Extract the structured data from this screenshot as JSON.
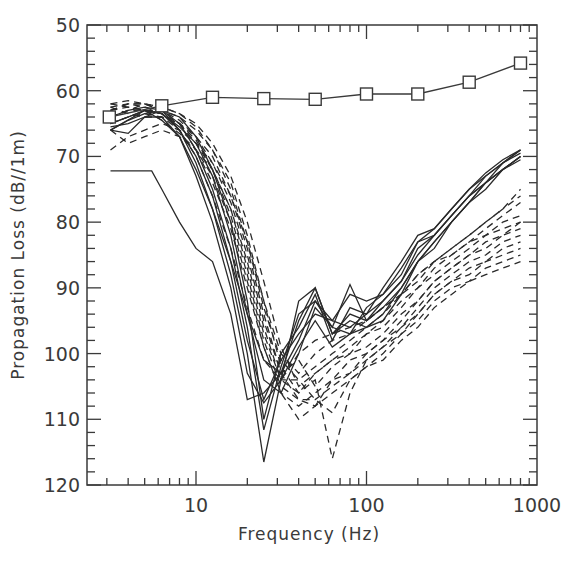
{
  "chart_data": {
    "type": "line",
    "title": "",
    "xlabel": "Frequency (Hz)",
    "ylabel": "Propagation Loss (dB//1m)",
    "xscale": "log",
    "xlim": [
      2.27,
      1000
    ],
    "ylim": [
      120,
      50
    ],
    "y_inverted": true,
    "grid": false,
    "legend": null,
    "x_tick_labels": [
      "10",
      "100",
      "1000"
    ],
    "x_ticks": [
      10,
      100,
      1000
    ],
    "y_tick_labels": [
      "50",
      "60",
      "70",
      "80",
      "90",
      "100",
      "110",
      "120"
    ],
    "y_ticks": [
      50,
      60,
      70,
      80,
      90,
      100,
      110,
      120
    ],
    "series": [
      {
        "name": "reference (square markers)",
        "style": "solid-markers",
        "marker": "square",
        "x": [
          3.1,
          6.3,
          12.5,
          25,
          50,
          100,
          200,
          400,
          800
        ],
        "values": [
          64.0,
          62.3,
          61.0,
          61.2,
          61.3,
          60.5,
          60.5,
          58.7,
          55.8
        ]
      },
      {
        "name": "solid 1",
        "style": "solid",
        "x": [
          3.15,
          5,
          6.3,
          8,
          10,
          12.5,
          16,
          20,
          25,
          31.5,
          40,
          50,
          63,
          80,
          100,
          125,
          160,
          200,
          250,
          315,
          400,
          500,
          630,
          800
        ],
        "values": [
          66.0,
          63.0,
          64.5,
          67.0,
          72.0,
          78.0,
          86.0,
          94.0,
          101.0,
          103.0,
          95.0,
          90.0,
          97.0,
          94.0,
          95.0,
          93.0,
          90.0,
          86.0,
          83.0,
          80.0,
          77.0,
          74.0,
          71.0,
          69.0
        ]
      },
      {
        "name": "solid 2",
        "style": "solid",
        "x": [
          3.15,
          5.5,
          6.3,
          8,
          10,
          12.5,
          16,
          20,
          25,
          31.5,
          40,
          50,
          63,
          80,
          100,
          125,
          160,
          200,
          250,
          315,
          400,
          500,
          630,
          800
        ],
        "values": [
          72.2,
          72.2,
          75.0,
          80.0,
          84.0,
          86.0,
          94.0,
          107.0,
          106.0,
          103.0,
          98.0,
          92.0,
          95.0,
          91.0,
          92.0,
          91.0,
          88.0,
          83.0,
          82.0,
          79.0,
          76.0,
          74.0,
          72.0,
          70.0
        ]
      },
      {
        "name": "solid 3",
        "style": "solid",
        "x": [
          3.15,
          4,
          5,
          6.3,
          8,
          10,
          12.5,
          16,
          20,
          25,
          31.5,
          40,
          50,
          63,
          80,
          100,
          125,
          160,
          200,
          250,
          315,
          400,
          500,
          630,
          800
        ],
        "values": [
          65.0,
          64.0,
          63.0,
          63.5,
          66.0,
          71.0,
          78.0,
          88.0,
          100.0,
          116.5,
          104.0,
          92.0,
          90.0,
          97.0,
          95.0,
          96.0,
          94.0,
          90.0,
          86.0,
          83.0,
          80.0,
          77.0,
          74.0,
          72.0,
          70.0
        ]
      },
      {
        "name": "solid 4",
        "style": "solid",
        "x": [
          3.15,
          4,
          5,
          6.3,
          8,
          10,
          12.5,
          16,
          20,
          25,
          31.5,
          40,
          50,
          63,
          80,
          100,
          125,
          160,
          200,
          250,
          315,
          400,
          500,
          630,
          800
        ],
        "values": [
          64.0,
          63.0,
          62.5,
          63.0,
          65.0,
          69.0,
          75.0,
          84.0,
          96.0,
          111.6,
          102.0,
          94.0,
          92.0,
          96.0,
          89.5,
          95.0,
          92.0,
          89.0,
          84.0,
          82.0,
          79.0,
          76.0,
          73.0,
          71.0,
          69.5
        ]
      },
      {
        "name": "solid 5",
        "style": "solid",
        "x": [
          3.15,
          4,
          5,
          6.3,
          8,
          10,
          12.5,
          16,
          20,
          25,
          31.5,
          40,
          50,
          63,
          80,
          100,
          125,
          160,
          200,
          250,
          315,
          400,
          500,
          630,
          800
        ],
        "values": [
          66.0,
          64.5,
          63.5,
          63.0,
          64.0,
          67.0,
          72.0,
          80.0,
          92.0,
          110.0,
          100.0,
          96.0,
          91.0,
          98.0,
          93.0,
          94.0,
          90.0,
          86.0,
          82.0,
          81.0,
          78.0,
          75.0,
          72.5,
          70.5,
          69.0
        ]
      },
      {
        "name": "solid 6",
        "style": "solid",
        "x": [
          3.15,
          4,
          5,
          6.3,
          8,
          10,
          12.5,
          16,
          20,
          25,
          31.5,
          40,
          50,
          63,
          80,
          100,
          125,
          160,
          200,
          250,
          315,
          400,
          500,
          630,
          800
        ],
        "values": [
          65.0,
          64.0,
          63.0,
          63.5,
          65.5,
          68.0,
          73.0,
          82.0,
          94.0,
          104.0,
          106.0,
          100.0,
          93.0,
          96.0,
          97.0,
          93.0,
          91.0,
          87.0,
          83.0,
          81.0,
          78.0,
          75.0,
          73.0,
          71.0,
          69.0
        ]
      },
      {
        "name": "solid 7",
        "style": "solid",
        "x": [
          3.15,
          4,
          5,
          6.3,
          8,
          10,
          12.5,
          16,
          20,
          25,
          31.5,
          40,
          50,
          63,
          80,
          100,
          125,
          160,
          200,
          250,
          315,
          400,
          500,
          630,
          800
        ],
        "values": [
          65.5,
          65.0,
          64.0,
          63.0,
          66.0,
          70.0,
          76.0,
          86.0,
          98.0,
          107.0,
          101.0,
          97.0,
          94.0,
          95.0,
          96.0,
          94.0,
          92.0,
          89.0,
          85.0,
          82.0,
          79.0,
          76.0,
          74.0,
          72.0,
          70.5
        ]
      },
      {
        "name": "solid 8",
        "style": "solid",
        "x": [
          3.15,
          4,
          5,
          6.3,
          8,
          10,
          12.5,
          16,
          20,
          25,
          31.5,
          40,
          50,
          63,
          80,
          100,
          125,
          160,
          200,
          250,
          315,
          400,
          500,
          630,
          800
        ],
        "values": [
          66.0,
          66.5,
          64.0,
          64.0,
          67.0,
          73.0,
          80.0,
          90.0,
          103.0,
          107.5,
          104.0,
          99.0,
          95.0,
          99.0,
          97.0,
          96.0,
          95.0,
          91.0,
          86.0,
          84.0,
          80.0,
          77.0,
          75.0,
          72.0,
          70.0
        ]
      },
      {
        "name": "dashed 1",
        "style": "dashed",
        "x": [
          3.15,
          4,
          5,
          6.3,
          8,
          10,
          12.5,
          16,
          20,
          25,
          31.5,
          40,
          50,
          63,
          80,
          100,
          125,
          160,
          200,
          250,
          315,
          400,
          500,
          630,
          800
        ],
        "values": [
          62.0,
          62.5,
          63.0,
          63.0,
          64.0,
          66.0,
          69.0,
          74.0,
          82.0,
          92.0,
          102.0,
          106.0,
          104.0,
          116.0,
          106.0,
          101.0,
          99.0,
          96.0,
          93.0,
          90.0,
          88.0,
          86.0,
          85.0,
          83.0,
          82.0
        ]
      },
      {
        "name": "dashed 2",
        "style": "dashed",
        "x": [
          3.15,
          4,
          5,
          6.3,
          8,
          10,
          12.5,
          16,
          20,
          25,
          31.5,
          40,
          50,
          63,
          80,
          100,
          125,
          160,
          200,
          250,
          315,
          400,
          500,
          630,
          800
        ],
        "values": [
          63.0,
          62.0,
          62.5,
          63.5,
          65.0,
          67.0,
          70.0,
          76.0,
          84.0,
          94.0,
          103.0,
          107.0,
          108.0,
          104.0,
          103.0,
          100.0,
          98.0,
          95.0,
          92.0,
          89.0,
          87.0,
          85.0,
          84.0,
          82.0,
          80.0
        ]
      },
      {
        "name": "dashed 3",
        "style": "dashed",
        "x": [
          3.15,
          4,
          5,
          6.3,
          8,
          10,
          12.5,
          16,
          20,
          25,
          31.5,
          40,
          50,
          63,
          80,
          100,
          125,
          160,
          200,
          250,
          315,
          400,
          500,
          630,
          800
        ],
        "values": [
          64.0,
          63.0,
          62.0,
          62.5,
          63.5,
          65.0,
          68.0,
          73.0,
          80.0,
          89.0,
          99.0,
          105.0,
          103.0,
          101.0,
          99.0,
          97.0,
          95.0,
          92.0,
          90.0,
          87.0,
          85.0,
          83.0,
          81.0,
          79.0,
          77.0
        ]
      },
      {
        "name": "dashed 4",
        "style": "dashed",
        "x": [
          3.15,
          4,
          5,
          6.3,
          8,
          10,
          12.5,
          16,
          20,
          25,
          31.5,
          40,
          50,
          63,
          80,
          100,
          125,
          160,
          200,
          250,
          315,
          400,
          500,
          630,
          800
        ],
        "values": [
          62.5,
          63.5,
          64.0,
          64.0,
          65.0,
          68.0,
          72.0,
          78.0,
          86.0,
          96.0,
          104.0,
          104.0,
          107.0,
          109.0,
          104.0,
          102.0,
          100.0,
          97.0,
          94.0,
          91.0,
          89.0,
          87.0,
          86.0,
          84.0,
          83.0
        ]
      },
      {
        "name": "dashed 5",
        "style": "dashed",
        "x": [
          3.15,
          4,
          5,
          6.3,
          8,
          10,
          12.5,
          16,
          20,
          25,
          31.5,
          40,
          50,
          63,
          80,
          100,
          125,
          160,
          200,
          250,
          315,
          400,
          500,
          630,
          800
        ],
        "values": [
          69.0,
          67.0,
          66.0,
          65.0,
          66.0,
          68.0,
          71.0,
          76.0,
          83.0,
          92.0,
          100.0,
          103.0,
          100.0,
          98.0,
          97.0,
          95.0,
          93.0,
          91.0,
          88.0,
          86.0,
          84.0,
          82.0,
          80.0,
          78.0,
          76.0
        ]
      },
      {
        "name": "dashed 6",
        "style": "dashed",
        "x": [
          3.15,
          4,
          5,
          6.3,
          8,
          10,
          12.5,
          16,
          20,
          25,
          31.5,
          40,
          50,
          63,
          80,
          100,
          125,
          160,
          200,
          250,
          315,
          400,
          500,
          630,
          800
        ],
        "values": [
          63.0,
          62.0,
          62.0,
          63.0,
          64.5,
          67.0,
          71.0,
          77.0,
          85.0,
          95.0,
          103.0,
          101.0,
          105.0,
          102.0,
          100.0,
          99.0,
          97.0,
          94.0,
          92.0,
          89.0,
          87.0,
          85.0,
          83.0,
          82.0,
          81.0
        ]
      },
      {
        "name": "dashed 7",
        "style": "dashed",
        "x": [
          3.15,
          4,
          5,
          6.3,
          8,
          10,
          12.5,
          16,
          20,
          25,
          31.5,
          40,
          50,
          63,
          80,
          100,
          125,
          160,
          200,
          250,
          315,
          400,
          500,
          630,
          800
        ],
        "values": [
          62.0,
          61.5,
          62.0,
          63.0,
          65.0,
          69.0,
          74.0,
          81.0,
          90.0,
          99.0,
          106.0,
          108.0,
          106.0,
          104.0,
          101.0,
          100.0,
          98.0,
          96.0,
          94.0,
          91.0,
          89.0,
          88.0,
          86.0,
          85.0,
          84.0
        ]
      },
      {
        "name": "dashed 8",
        "style": "dashed",
        "x": [
          3.15,
          4,
          5,
          6.3,
          8,
          10,
          12.5,
          16,
          20,
          25,
          31.5,
          40,
          50,
          63,
          80,
          100,
          125,
          160,
          200,
          250,
          315,
          400,
          500,
          630,
          800
        ],
        "values": [
          66.0,
          68.0,
          67.0,
          66.0,
          67.0,
          69.0,
          72.0,
          78.0,
          87.0,
          97.0,
          104.0,
          106.0,
          103.0,
          101.0,
          100.0,
          97.0,
          96.0,
          93.0,
          90.0,
          88.0,
          86.0,
          84.0,
          82.0,
          80.0,
          79.0
        ]
      },
      {
        "name": "dashed 9",
        "style": "dashed",
        "x": [
          3.15,
          4,
          5,
          6.3,
          8,
          10,
          12.5,
          16,
          20,
          25,
          31.5,
          40,
          50,
          63,
          80,
          100,
          125,
          160,
          200,
          250,
          315,
          400,
          500,
          630,
          800
        ],
        "values": [
          62.5,
          62.0,
          62.0,
          62.5,
          63.5,
          65.5,
          69.0,
          75.0,
          83.0,
          93.0,
          101.0,
          104.0,
          102.0,
          100.0,
          98.0,
          96.0,
          94.0,
          91.0,
          89.0,
          86.0,
          84.0,
          82.0,
          80.0,
          78.0,
          75.0
        ]
      },
      {
        "name": "dashed 10",
        "style": "dashed",
        "x": [
          3.15,
          4,
          5,
          6.3,
          8,
          10,
          12.5,
          16,
          20,
          25,
          31.5,
          40,
          50,
          63,
          80,
          100,
          125,
          160,
          200,
          250,
          315,
          400,
          500,
          630,
          800
        ],
        "values": [
          64.0,
          63.0,
          63.0,
          63.5,
          65.0,
          67.5,
          72.0,
          79.0,
          88.0,
          98.0,
          105.0,
          107.0,
          107.0,
          105.0,
          103.0,
          101.0,
          99.0,
          97.0,
          95.0,
          92.0,
          90.0,
          89.0,
          87.0,
          86.0,
          85.0
        ]
      },
      {
        "name": "dashed 11",
        "style": "dashed",
        "x": [
          3.15,
          4,
          5,
          6.3,
          8,
          10,
          12.5,
          16,
          20,
          25,
          31.5,
          40,
          50,
          63,
          80,
          100,
          125,
          160,
          200,
          250,
          315,
          400,
          500,
          630,
          800
        ],
        "values": [
          65.0,
          64.0,
          63.5,
          64.0,
          66.0,
          70.0,
          76.0,
          84.0,
          93.0,
          101.0,
          104.0,
          100.0,
          98.0,
          97.0,
          96.0,
          95.0,
          93.0,
          91.0,
          88.0,
          86.0,
          85.0,
          83.0,
          82.0,
          81.0,
          80.0
        ]
      },
      {
        "name": "dashed 12",
        "style": "dashed",
        "x": [
          3.15,
          4,
          5,
          6.3,
          8,
          10,
          12.5,
          16,
          20,
          25,
          31.5,
          40,
          50,
          63,
          80,
          100,
          125,
          160,
          200,
          250,
          315,
          400,
          500,
          630,
          800
        ],
        "values": [
          63.0,
          62.5,
          63.0,
          64.5,
          66.5,
          69.0,
          73.0,
          80.0,
          89.0,
          99.0,
          106.0,
          110.0,
          108.0,
          106.0,
          104.0,
          102.0,
          101.0,
          98.0,
          96.0,
          93.0,
          91.0,
          89.0,
          88.0,
          87.0,
          86.0
        ]
      }
    ]
  }
}
